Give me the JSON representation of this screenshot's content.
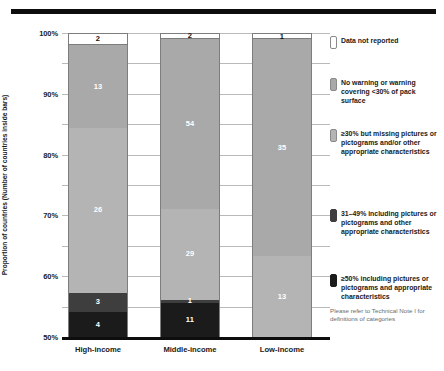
{
  "chart_data": {
    "type": "bar",
    "title": "",
    "xlabel": "",
    "ylabel": "Proportion of countries (Number of countries inside bars)",
    "ylim": [
      0,
      100
    ],
    "y_unit": "%",
    "grid": true,
    "stacked": true,
    "stack_normalized_percent": true,
    "legend_position": "right",
    "categories": [
      "High-income",
      "Middle-income",
      "Low-income"
    ],
    "yticks": [
      "0%",
      "10%",
      "20%",
      "30%",
      "40%",
      "50%",
      "60%",
      "70%",
      "80%",
      "90%",
      "100%"
    ],
    "ytick_values": [
      0,
      10,
      20,
      30,
      40,
      50,
      60,
      70,
      80,
      90,
      100
    ],
    "series": [
      {
        "name": "Data not reported",
        "color": "#ffffff",
        "values": [
          2,
          2,
          1
        ],
        "percents": [
          4.2,
          2.1,
          2.0
        ]
      },
      {
        "name": "No warning or warning covering <30% of pack surface",
        "color": "#a9a9a9",
        "values": [
          13,
          54,
          35
        ],
        "percents": [
          27.1,
          55.7,
          71.4
        ]
      },
      {
        "name": "≥30% but missing pictures or pictograms and/or other appropriate characteristics",
        "color": "#b4b4b4",
        "values": [
          26,
          29,
          13
        ],
        "percents": [
          54.2,
          29.9,
          26.5
        ]
      },
      {
        "name": "31–49% including pictures or pictograms and other appropriate characteristics",
        "color": "#3e3e3e",
        "values": [
          3,
          1,
          0
        ],
        "percents": [
          6.3,
          1.0,
          0
        ]
      },
      {
        "name": "≥50% including pictures or pictograms and appropriate characteristics",
        "color": "#1b1b1b",
        "values": [
          4,
          11,
          0
        ],
        "percents": [
          8.3,
          11.3,
          0
        ]
      }
    ],
    "bar_totals": [
      48,
      97,
      49
    ],
    "annotations": [
      "Please refer to Technical Note I for definitions of categories"
    ]
  },
  "axis": {
    "y_title": "Proportion of countries (Number of countries inside bars)",
    "ticks": [
      {
        "label": "100%",
        "value": 100
      },
      {
        "label": "90%",
        "value": 90
      },
      {
        "label": "80%",
        "value": 80
      },
      {
        "label": "70%",
        "value": 70
      },
      {
        "label": "60%",
        "value": 60
      },
      {
        "label": "50%",
        "value": 50
      },
      {
        "label": "40%",
        "value": 40
      },
      {
        "label": "30%",
        "value": 30
      },
      {
        "label": "20%",
        "value": 20
      },
      {
        "label": "10%",
        "value": 10
      },
      {
        "label": "0%",
        "value": 0
      }
    ]
  },
  "bars": [
    {
      "category": "High-income",
      "segments": [
        {
          "label": "2",
          "style": "s-white",
          "percent": 4.2
        },
        {
          "label": "13",
          "style": "s-mid",
          "percent": 27.1
        },
        {
          "label": "26",
          "style": "s-light",
          "percent": 54.2
        },
        {
          "label": "3",
          "style": "s-dark",
          "percent": 6.3
        },
        {
          "label": "4",
          "style": "s-black",
          "percent": 8.3
        }
      ]
    },
    {
      "category": "Middle-income",
      "segments": [
        {
          "label": "2",
          "style": "s-white",
          "percent": 2.1
        },
        {
          "label": "54",
          "style": "s-mid",
          "percent": 55.7
        },
        {
          "label": "29",
          "style": "s-light",
          "percent": 29.9
        },
        {
          "label": "1",
          "style": "s-dark",
          "percent": 1.0
        },
        {
          "label": "11",
          "style": "s-black",
          "percent": 11.3
        }
      ]
    },
    {
      "category": "Low-income",
      "segments": [
        {
          "label": "1",
          "style": "s-white",
          "percent": 2.0
        },
        {
          "label": "35",
          "style": "s-mid",
          "percent": 71.4
        },
        {
          "label": "13",
          "style": "s-light",
          "percent": 26.5
        }
      ]
    }
  ],
  "legend": {
    "items": [
      {
        "swatch": "sw-white",
        "text": "Data not reported",
        "top": 3
      },
      {
        "swatch": "sw-mid",
        "text": "No warning or warning covering <30% of pack surface",
        "top": 45
      },
      {
        "swatch": "sw-light",
        "text": "≥30% but missing pictures or pictograms and/or other appropriate characteristics",
        "top": 96
      },
      {
        "swatch": "sw-dark",
        "text": "31–49% including pictures or pictograms and other appropriate characteristics",
        "top": 176
      },
      {
        "swatch": "sw-black",
        "text": "≥50% including pictures or pictograms and appropriate characteristics",
        "top": 241
      }
    ],
    "footnote": "Please refer to Technical Note I for definitions of categories"
  }
}
